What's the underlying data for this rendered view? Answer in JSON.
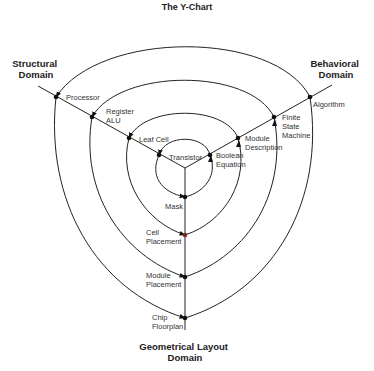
{
  "title": "The Y-Chart",
  "domains": {
    "structural": [
      "Structural",
      "Domain"
    ],
    "behavioral": [
      "Behavioral",
      "Domain"
    ],
    "geometrical": [
      "Geometrical Layout",
      "Domain"
    ]
  },
  "levels": [
    {
      "structural": [
        "Transistor"
      ],
      "behavioral": [
        "Boolean",
        "Equation"
      ],
      "geometrical": [
        "Mask"
      ]
    },
    {
      "structural": [
        "Leaf Cell"
      ],
      "behavioral": [
        "Module",
        "Description"
      ],
      "geometrical": [
        "Cell",
        "Placement"
      ]
    },
    {
      "structural": [
        "Register",
        "ALU"
      ],
      "behavioral": [
        "Finite",
        "State",
        "Machine"
      ],
      "geometrical": [
        "Module",
        "Placement"
      ]
    },
    {
      "structural": [
        "Processor"
      ],
      "behavioral": [
        "Algorithm"
      ],
      "geometrical": [
        "Chip",
        "Floorplan"
      ]
    }
  ],
  "colors": {
    "line": "#222222",
    "text": "#333333",
    "accent_dot": "#7a2a1a"
  }
}
